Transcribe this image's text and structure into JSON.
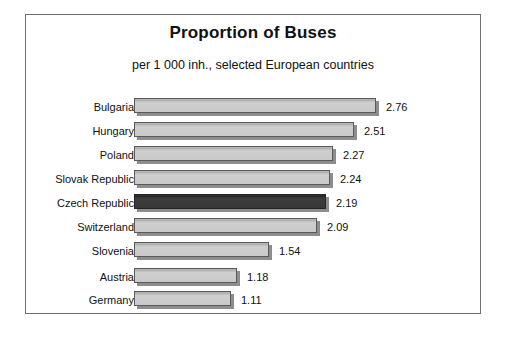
{
  "chart_data": {
    "type": "bar",
    "orientation": "horizontal",
    "title": "Proportion of Buses",
    "subtitle": "per 1 000 inh., selected European countries",
    "xlabel": "",
    "ylabel": "",
    "xlim": [
      0,
      3.0
    ],
    "grid": false,
    "legend": "none",
    "highlight_category": "Czech Republic",
    "highlight_color": "#383838",
    "bar_color": "#c9c9c9",
    "categories": [
      "Bulgaria",
      "Hungary",
      "Poland",
      "Slovak Republic",
      "Czech Republic",
      "Switzerland",
      "Slovenia",
      "Austria",
      "Germany"
    ],
    "values": [
      2.76,
      2.51,
      2.27,
      2.24,
      2.19,
      2.09,
      1.54,
      1.18,
      1.11
    ],
    "value_labels": [
      "2.76",
      "2.51",
      "2.27",
      "2.24",
      "2.19",
      "2.09",
      "1.54",
      "1.18",
      "1.11"
    ]
  },
  "bars": [
    {
      "label": "Bulgaria",
      "value": 2.76,
      "value_label": "2.76",
      "highlight": false,
      "top": 4,
      "width": 242
    },
    {
      "label": "Hungary",
      "value": 2.51,
      "value_label": "2.51",
      "highlight": false,
      "top": 28,
      "width": 220
    },
    {
      "label": "Poland",
      "value": 2.27,
      "value_label": "2.27",
      "highlight": false,
      "top": 52,
      "width": 199
    },
    {
      "label": "Slovak Republic",
      "value": 2.24,
      "value_label": "2.24",
      "highlight": false,
      "top": 76,
      "width": 196
    },
    {
      "label": "Czech Republic",
      "value": 2.19,
      "value_label": "2.19",
      "highlight": true,
      "top": 100,
      "width": 192
    },
    {
      "label": "Switzerland",
      "value": 2.09,
      "value_label": "2.09",
      "highlight": false,
      "top": 124,
      "width": 183
    },
    {
      "label": "Slovenia",
      "value": 1.54,
      "value_label": "1.54",
      "highlight": false,
      "top": 148,
      "width": 135
    },
    {
      "label": "Austria",
      "value": 1.18,
      "value_label": "1.18",
      "highlight": false,
      "top": 174,
      "width": 103
    },
    {
      "label": "Germany",
      "value": 1.11,
      "value_label": "1.11",
      "highlight": false,
      "top": 197,
      "width": 97
    }
  ]
}
